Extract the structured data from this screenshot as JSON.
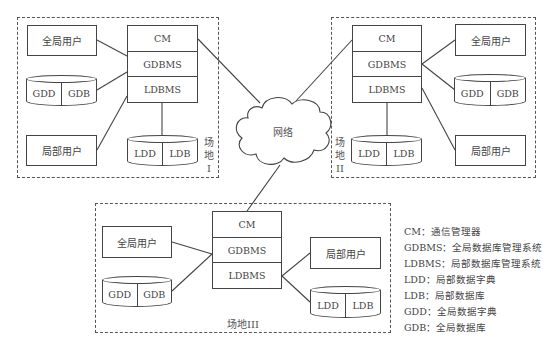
{
  "network": {
    "label": "网络"
  },
  "sites": [
    {
      "id": "site-1",
      "label": "场地I",
      "label_chars": [
        "场",
        "地",
        "I"
      ],
      "global_user": "全局用户",
      "local_user": "局部用户",
      "stack": [
        "CM",
        "GDBMS",
        "LDBMS"
      ],
      "global_db": [
        "GDD",
        "GDB"
      ],
      "local_db": [
        "LDD",
        "LDB"
      ]
    },
    {
      "id": "site-2",
      "label": "场地II",
      "label_chars": [
        "场",
        "地",
        "II"
      ],
      "global_user": "全局用户",
      "local_user": "局部用户",
      "stack": [
        "CM",
        "GDBMS",
        "LDBMS"
      ],
      "global_db": [
        "GDD",
        "GDB"
      ],
      "local_db": [
        "LDD",
        "LDB"
      ]
    },
    {
      "id": "site-3",
      "label": "场地III",
      "global_user": "全局用户",
      "local_user": "局部用户",
      "stack": [
        "CM",
        "GDBMS",
        "LDBMS"
      ],
      "global_db": [
        "GDD",
        "GDB"
      ],
      "local_db": [
        "LDD",
        "LDB"
      ]
    }
  ],
  "legend": [
    "CM：通信管理器",
    "GDBMS：全局数据库管理系统",
    "LDBMS：局部数据库管理系统",
    "LDD：局部数据字典",
    "LDB：局部数据库",
    "GDD：全局数据字典",
    "GDB：全局数据库"
  ]
}
